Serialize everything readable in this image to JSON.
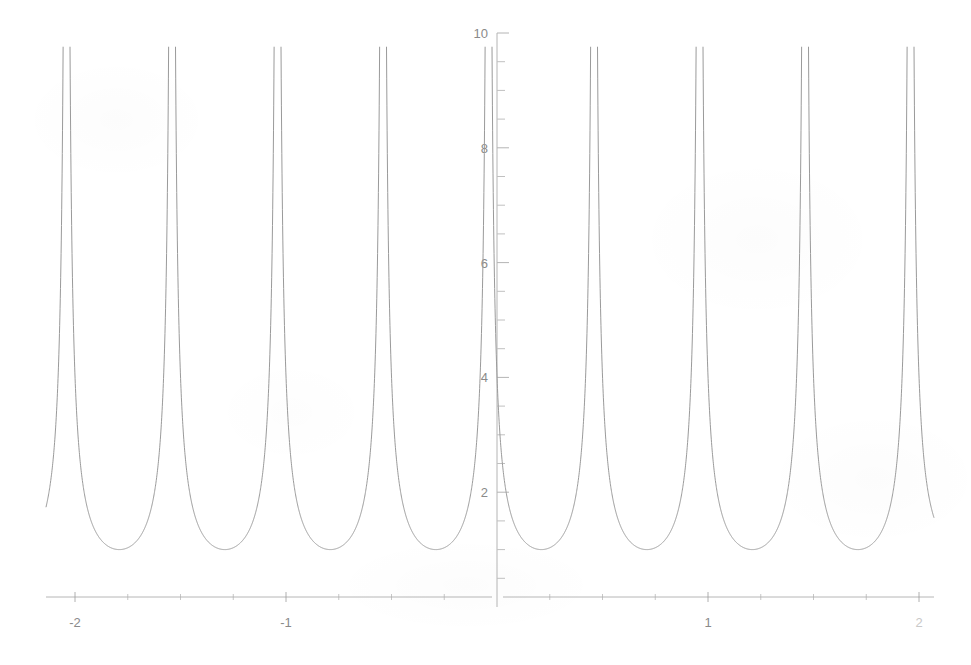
{
  "figure": {
    "background_color": "#ffffff",
    "curve_color": "#9a9a9a",
    "axis_color": "#b4b4b4",
    "tick_label_color": "#8a8a8a",
    "faded_label_color": "#c9c9c9"
  },
  "chart_data": {
    "type": "line",
    "title": "",
    "subtitle": "",
    "xlabel": "",
    "ylabel": "",
    "xlim": [
      -2.18,
      2.22
    ],
    "ylim": [
      0,
      10
    ],
    "grid": false,
    "legend": null,
    "annotations": [],
    "x_ticks_major": [
      -2,
      -1,
      1,
      2
    ],
    "x_tick_labels": [
      "-2",
      "-1",
      "1",
      "2"
    ],
    "x_ticks_minor": [
      -1.75,
      -1.5,
      -1.25,
      -0.75,
      -0.5,
      -0.25,
      0.25,
      0.5,
      0.75,
      1.25,
      1.5,
      1.75
    ],
    "y_ticks_major": [
      2,
      4,
      6,
      8,
      10
    ],
    "y_tick_labels": [
      "2",
      "4",
      "6",
      "8",
      "10"
    ],
    "y_ticks_minor": [
      0.5,
      1,
      1.5,
      2.5,
      3,
      3.5,
      4.5,
      5,
      5.5,
      6.5,
      7,
      7.5,
      8.5,
      9,
      9.5
    ],
    "function": "|sec(2*pi*x + 0.46*pi)|",
    "period": 0.5,
    "minimum_value": 1,
    "minima_x": [
      -1.79,
      -1.29,
      -0.8,
      -0.3,
      0.23,
      0.72,
      1.21,
      1.7
    ],
    "minima_y": [
      1,
      1,
      1,
      1,
      1,
      1,
      1,
      1
    ],
    "asymptotes_x": [
      -1.98,
      -1.59,
      -1.48,
      -1.1,
      -0.99,
      -0.6,
      -0.49,
      -0.1,
      0.02,
      0.42,
      0.52,
      0.91,
      1.02,
      1.4,
      1.5,
      1.9
    ],
    "series": [
      {
        "name": "curve",
        "color": "#9a9a9a",
        "style": "solid",
        "width": 1
      }
    ]
  }
}
